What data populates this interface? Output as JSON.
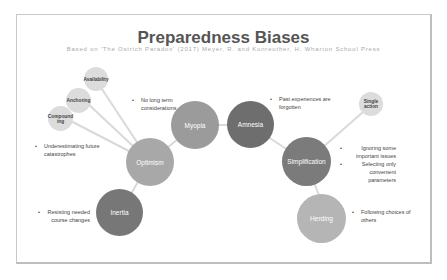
{
  "title": "Preparedness Biases",
  "subtitle": "Based on 'The Ostrich Paradox' (2017) Meyer, R. and Kunreuther, H. Wharton School Press",
  "nodes": {
    "optimism": {
      "label": "Optimism",
      "color": "#a8a8a8"
    },
    "myopia": {
      "label": "Myopia",
      "color": "#9b9b9b"
    },
    "amnesia": {
      "label": "Amnesia",
      "color": "#6e6e6e"
    },
    "simplification": {
      "label": "Simplification",
      "color": "#7b7b7b"
    },
    "inertia": {
      "label": "Inertia",
      "color": "#777777"
    },
    "herding": {
      "label": "Herding",
      "color": "#b5b5b5"
    },
    "availability": {
      "label": "Availability",
      "color": "#dcdcdc"
    },
    "anchoring": {
      "label": "Anchoring",
      "color": "#dcdcdc"
    },
    "compounding": {
      "label": "Compound ing",
      "color": "#dcdcdc"
    },
    "single_action": {
      "label": "Single action",
      "color": "#dcdcdc"
    }
  },
  "notes": {
    "myopia": [
      "No long term considerations"
    ],
    "amnesia": [
      "Past experiences are forgotten"
    ],
    "optimism": [
      "Underestimating future catastrophes"
    ],
    "simplification": [
      "Ignoring some important issues",
      "Selecting only convenient parameters"
    ],
    "inertia": [
      "Resisting needed course changes"
    ],
    "herding": [
      "Following choices of others"
    ]
  },
  "line_color": "#d9d9d9"
}
